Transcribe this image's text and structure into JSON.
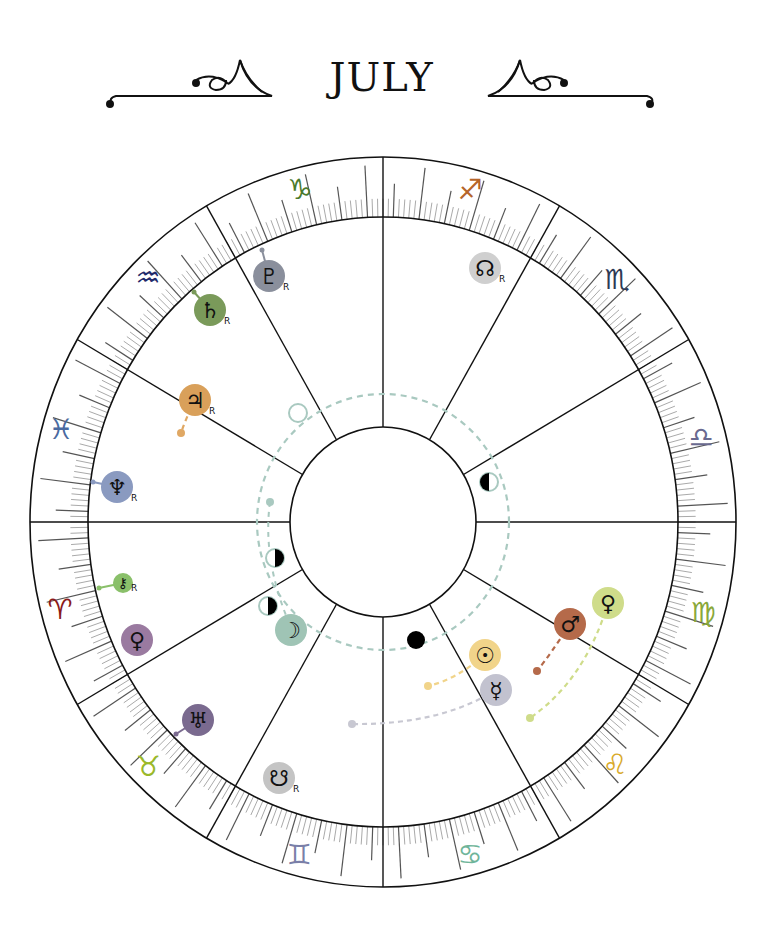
{
  "header": {
    "title": "JULY",
    "ornament_left": "flourish-left",
    "ornament_right": "flourish-right"
  },
  "chart": {
    "type": "astrological-wheel",
    "center": [
      383,
      522
    ],
    "outer_radius": [
      353,
      365
    ],
    "zodiac_inner_radius": [
      295,
      305
    ],
    "inner_circle_radius": [
      93,
      95
    ],
    "house_cusps_deg": [
      0,
      30,
      60,
      90,
      120,
      150,
      180,
      210,
      240,
      270,
      300,
      330
    ],
    "signs": [
      {
        "name": "Capricorn",
        "glyph": "♑",
        "color": "#4a7a2c",
        "x": 300,
        "y": 190
      },
      {
        "name": "Sagittarius",
        "glyph": "♐",
        "color": "#b5652a",
        "x": 470,
        "y": 190
      },
      {
        "name": "Scorpio",
        "glyph": "♏",
        "color": "#2e3a55",
        "x": 617,
        "y": 280
      },
      {
        "name": "Libra",
        "glyph": "♎",
        "color": "#6a6a90",
        "x": 701,
        "y": 438
      },
      {
        "name": "Virgo",
        "glyph": "♍",
        "color": "#8aa83a",
        "x": 703,
        "y": 613
      },
      {
        "name": "Leo",
        "glyph": "♌",
        "color": "#d9aa2a",
        "x": 615,
        "y": 765
      },
      {
        "name": "Cancer",
        "glyph": "♋",
        "color": "#6fb59a",
        "x": 470,
        "y": 855
      },
      {
        "name": "Gemini",
        "glyph": "♊",
        "color": "#7a7fa8",
        "x": 299,
        "y": 855
      },
      {
        "name": "Taurus",
        "glyph": "♉",
        "color": "#9ab82a",
        "x": 148,
        "y": 767
      },
      {
        "name": "Aries",
        "glyph": "♈",
        "color": "#8a1a1a",
        "x": 60,
        "y": 610
      },
      {
        "name": "Pisces",
        "glyph": "♓",
        "color": "#4a6aa0",
        "x": 61,
        "y": 430
      },
      {
        "name": "Aquarius",
        "glyph": "♒",
        "color": "#1f2a6a",
        "x": 148,
        "y": 278
      }
    ],
    "planets": [
      {
        "name": "Pluto",
        "glyph": "♇",
        "retrograde": true,
        "color": "#8a8f9c",
        "x": 269,
        "y": 276
      },
      {
        "name": "Saturn",
        "glyph": "♄",
        "retrograde": true,
        "color": "#7a9a5a",
        "x": 210,
        "y": 310
      },
      {
        "name": "Jupiter",
        "glyph": "♃",
        "retrograde": true,
        "color": "#d9a05a",
        "x": 195,
        "y": 400
      },
      {
        "name": "Neptune",
        "glyph": "♆",
        "retrograde": true,
        "color": "#8a9ac0",
        "x": 117,
        "y": 487
      },
      {
        "name": "Chiron",
        "glyph": "⚷",
        "retrograde": true,
        "color": "#8ac06a",
        "x": 123,
        "y": 583
      },
      {
        "name": "Venus-alt",
        "glyph": "♀",
        "retrograde": false,
        "color": "#9a7aa0",
        "x": 137,
        "y": 640
      },
      {
        "name": "Uranus",
        "glyph": "♅",
        "retrograde": false,
        "color": "#7a6a8f",
        "x": 198,
        "y": 720
      },
      {
        "name": "South Node",
        "glyph": "☋",
        "retrograde": true,
        "color": "#c4c4c4",
        "x": 279,
        "y": 778
      },
      {
        "name": "North Node",
        "glyph": "☊",
        "retrograde": true,
        "color": "#cfcfcf",
        "x": 485,
        "y": 268
      },
      {
        "name": "Sun",
        "glyph": "☉",
        "retrograde": false,
        "color": "#f1d48a",
        "x": 485,
        "y": 655
      },
      {
        "name": "Mercury",
        "glyph": "☿",
        "retrograde": false,
        "color": "#c2c2cf",
        "x": 496,
        "y": 690
      },
      {
        "name": "Mars",
        "glyph": "♂",
        "retrograde": false,
        "color": "#b56a4a",
        "x": 570,
        "y": 624
      },
      {
        "name": "Venus",
        "glyph": "♀",
        "retrograde": false,
        "color": "#cfdc8a",
        "x": 608,
        "y": 603
      },
      {
        "name": "Moon",
        "glyph": "☽",
        "retrograde": false,
        "color": "#9fc4b5",
        "x": 291,
        "y": 630
      }
    ],
    "moon_phases": [
      {
        "phase": "new-moon",
        "x": 416,
        "y": 640
      },
      {
        "phase": "first-quarter",
        "x": 489,
        "y": 482
      },
      {
        "phase": "full-moon",
        "x": 298,
        "y": 413
      },
      {
        "phase": "last-quarter",
        "x": 275,
        "y": 558
      },
      {
        "phase": "last-quarter",
        "x": 268,
        "y": 606
      }
    ],
    "retrograde_label": "R"
  }
}
